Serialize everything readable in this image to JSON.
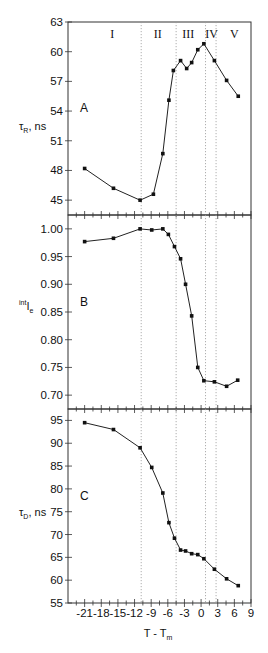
{
  "chart_data": [
    {
      "type": "line",
      "panel": "A",
      "title": "",
      "xlabel": "T - Tm",
      "ylabel": "τR, ns",
      "ylim": [
        43.5,
        63
      ],
      "xlim": [
        -24,
        9
      ],
      "yticks": [
        45,
        48,
        51,
        54,
        57,
        60,
        63
      ],
      "grid": false,
      "region_labels": [
        "I",
        "II",
        "III",
        "IV",
        "V"
      ],
      "x": [
        -21,
        -15.8,
        -11,
        -8.6,
        -6.9,
        -5.8,
        -5,
        -3.7,
        -2.6,
        -1.7,
        -0.6,
        0.5,
        2.4,
        4.6,
        6.7
      ],
      "values": [
        48.2,
        46.2,
        45.0,
        45.6,
        49.7,
        55.1,
        58.1,
        59.1,
        58.3,
        58.9,
        60.2,
        60.8,
        59.1,
        57.1,
        55.5
      ]
    },
    {
      "type": "line",
      "panel": "B",
      "title": "",
      "xlabel": "T - Tm",
      "ylabel": "intIe",
      "ylim": [
        0.675,
        1.025
      ],
      "xlim": [
        -24,
        9
      ],
      "yticks": [
        "0.70",
        "0.75",
        "0.80",
        "0.85",
        "0.90",
        "0.95",
        "1.00"
      ],
      "grid": false,
      "x": [
        -21,
        -15.8,
        -11,
        -8.9,
        -6.9,
        -5.9,
        -4.8,
        -3.7,
        -2.8,
        -1.7,
        -0.6,
        0.5,
        2.4,
        4.6,
        6.6
      ],
      "values": [
        0.977,
        0.983,
        1.0,
        0.998,
        1.0,
        0.99,
        0.968,
        0.946,
        0.9,
        0.843,
        0.75,
        0.726,
        0.724,
        0.716,
        0.727
      ]
    },
    {
      "type": "line",
      "panel": "C",
      "title": "",
      "xlabel": "T - Tm",
      "ylabel": "τD, ns",
      "ylim": [
        55,
        97.5
      ],
      "xlim": [
        -24,
        9
      ],
      "yticks": [
        55,
        60,
        65,
        70,
        75,
        80,
        85,
        90,
        95
      ],
      "xticks": [
        -21,
        -18,
        -15,
        -12,
        -9,
        -6,
        -3,
        0,
        3,
        6,
        9
      ],
      "grid": false,
      "x": [
        -21,
        -15.8,
        -11,
        -8.9,
        -6.9,
        -5.8,
        -4.8,
        -3.7,
        -2.8,
        -1.7,
        -0.6,
        0.5,
        2.4,
        4.6,
        6.7
      ],
      "values": [
        94.5,
        93.0,
        89.0,
        84.7,
        79.1,
        72.6,
        69.2,
        66.6,
        66.4,
        65.8,
        65.6,
        64.7,
        62.4,
        60.3,
        58.8
      ]
    }
  ],
  "figure": {
    "x_axis_title_main": "T - T",
    "x_axis_title_sub": "m",
    "dotted_lines_x": [
      -10.8,
      -4.5,
      0.8,
      2.7
    ],
    "region_labels": [
      {
        "text": "I",
        "x": -16
      },
      {
        "text": "II",
        "x": -7.8
      },
      {
        "text": "III",
        "x": -2.3
      },
      {
        "text": "IV",
        "x": 1.9
      },
      {
        "text": "V",
        "x": 6.0
      }
    ],
    "panels": {
      "A": {
        "letter": "A",
        "ylabel_main": "τ",
        "ylabel_sub": "R",
        "ylabel_unit": ", ns"
      },
      "B": {
        "letter": "B",
        "ylabel_sup": "int",
        "ylabel_main": "I",
        "ylabel_sub": "e"
      },
      "C": {
        "letter": "C",
        "ylabel_main": "τ",
        "ylabel_sub": "D",
        "ylabel_unit": ", ns"
      }
    },
    "colors": {
      "line": "#222222",
      "axis": "#333333",
      "dotted": "#999999",
      "marker": "#111111"
    }
  }
}
